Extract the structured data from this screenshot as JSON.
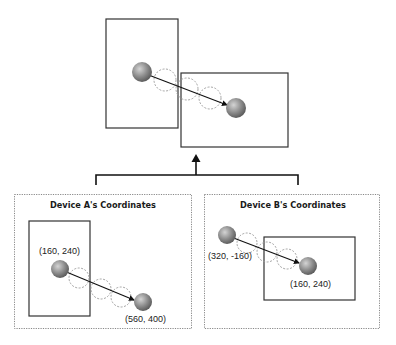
{
  "diagram": {
    "combined_view": {
      "device_a_rect": {
        "x": 106,
        "y": 19,
        "w": 72,
        "h": 109
      },
      "device_b_rect": {
        "x": 181,
        "y": 73,
        "w": 107,
        "h": 74
      },
      "start_ball": {
        "cx": 142,
        "cy": 72
      },
      "end_ball": {
        "cx": 236,
        "cy": 108
      },
      "trail_circles": [
        {
          "cx": 165,
          "cy": 80
        },
        {
          "cx": 187,
          "cy": 89
        },
        {
          "cx": 210,
          "cy": 98
        }
      ]
    },
    "connector": {
      "arrow": "up"
    },
    "panels": [
      {
        "title": "Device A's Coordinates",
        "start_label": "(160, 240)",
        "end_label": "(560, 400)"
      },
      {
        "title": "Device B's Coordinates",
        "start_label": "(320, -160)",
        "end_label": "(160, 240)"
      }
    ],
    "colors": {
      "stroke": "#333333",
      "ball_light": "#bdbdbd",
      "ball_dark": "#5e5e5e",
      "dotted_border": "#888888"
    }
  }
}
